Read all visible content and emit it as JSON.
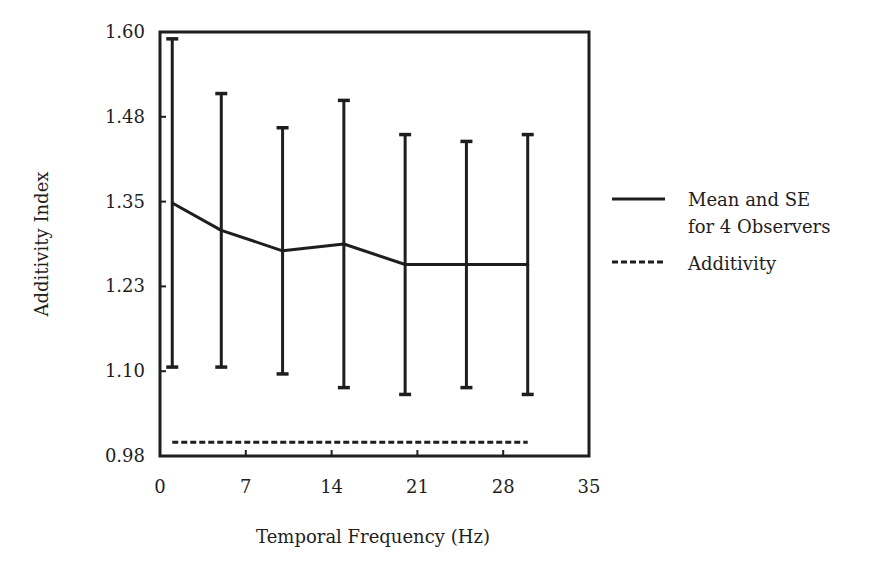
{
  "chart_data": {
    "type": "line",
    "title": "",
    "xlabel": "Temporal Frequency (Hz)",
    "ylabel": "Additivity Index",
    "xlim": [
      0,
      35
    ],
    "ylim": [
      0.98,
      1.6
    ],
    "xticks": [
      0,
      7,
      14,
      21,
      28,
      35
    ],
    "xtick_labels": [
      "0",
      "7",
      "14",
      "21",
      "28",
      "35"
    ],
    "yticks": [
      0.98,
      1.104,
      1.228,
      1.352,
      1.476,
      1.6
    ],
    "ytick_labels": [
      "0.98",
      "1.10",
      "1.23",
      "1.35",
      "1.48",
      "1.60"
    ],
    "grid": false,
    "legend_position": "right",
    "series": [
      {
        "name": "Mean and SE for 4 Observers",
        "style": "solid",
        "x": [
          1,
          5,
          10,
          15,
          20,
          25,
          30
        ],
        "y": [
          1.35,
          1.31,
          1.28,
          1.29,
          1.26,
          1.26,
          1.26
        ],
        "error_upper": [
          1.59,
          1.51,
          1.46,
          1.5,
          1.45,
          1.44,
          1.45
        ],
        "error_lower": [
          1.11,
          1.11,
          1.1,
          1.08,
          1.07,
          1.08,
          1.07
        ]
      },
      {
        "name": "Additivity",
        "style": "dashed",
        "x": [
          1,
          30
        ],
        "y": [
          1.0,
          1.0
        ]
      }
    ],
    "legend": [
      {
        "lines": [
          "Mean and SE",
          "for 4 Observers"
        ],
        "style": "solid"
      },
      {
        "lines": [
          "Additivity"
        ],
        "style": "dashed"
      }
    ],
    "colors": {
      "ink": "#1e1e1e",
      "background": "#ffffff"
    }
  }
}
